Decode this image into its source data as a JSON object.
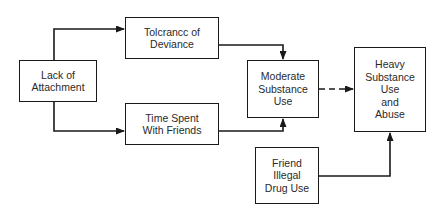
{
  "diagram": {
    "type": "flow",
    "nodes": [
      {
        "id": "lack",
        "label": "Lack of\nAttachment"
      },
      {
        "id": "tolerance",
        "label": "Tolcrancc of\nDeviance"
      },
      {
        "id": "time",
        "label": "Time Spent\nWith Friends"
      },
      {
        "id": "moderate",
        "label": "Moderate\nSubstance\nUse"
      },
      {
        "id": "heavy",
        "label": "Heavy\nSubstance\nUse\nand\nAbuse"
      },
      {
        "id": "friend",
        "label": "Friend\nIllegal\nDrug Use"
      }
    ],
    "edges": [
      {
        "from": "lack",
        "to": "tolerance",
        "style": "solid"
      },
      {
        "from": "lack",
        "to": "time",
        "style": "solid"
      },
      {
        "from": "tolerance",
        "to": "moderate",
        "style": "solid"
      },
      {
        "from": "time",
        "to": "moderate",
        "style": "solid"
      },
      {
        "from": "moderate",
        "to": "heavy",
        "style": "dashed"
      },
      {
        "from": "friend",
        "to": "heavy",
        "style": "solid"
      }
    ],
    "colors": {
      "line": "#1a1a1a",
      "text": "#2a2a2a",
      "background": "#ffffff"
    }
  }
}
